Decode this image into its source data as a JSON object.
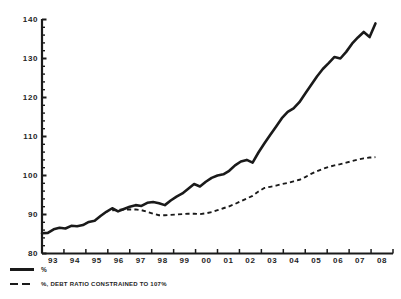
{
  "chart_data": {
    "type": "line",
    "title": "",
    "subtitle": "",
    "xlabel": "",
    "ylabel": "",
    "ylim": [
      80,
      140
    ],
    "ytick_step": 10,
    "yticks": [
      80,
      90,
      100,
      110,
      120,
      130,
      140
    ],
    "minor_ticks": true,
    "grid": false,
    "legend_position": "below-left",
    "xticks": [
      "93",
      "94",
      "95",
      "96",
      "97",
      "98",
      "99",
      "00",
      "01",
      "02",
      "03",
      "04",
      "05",
      "06",
      "07",
      "08"
    ],
    "x_range": [
      1993,
      2008
    ],
    "series": [
      {
        "name": "%",
        "style": "solid",
        "color": "#1a1a1a",
        "x": [
          1993.0,
          1993.25,
          1993.5,
          1993.75,
          1994.0,
          1994.25,
          1994.5,
          1994.75,
          1995.0,
          1995.25,
          1995.5,
          1995.75,
          1996.0,
          1996.25,
          1996.5,
          1996.75,
          1997.0,
          1997.25,
          1997.5,
          1997.75,
          1998.0,
          1998.25,
          1998.5,
          1998.75,
          1999.0,
          1999.25,
          1999.5,
          1999.75,
          2000.0,
          2000.25,
          2000.5,
          2000.75,
          2001.0,
          2001.25,
          2001.5,
          2001.75,
          2002.0,
          2002.25,
          2002.5,
          2002.75,
          2003.0,
          2003.25,
          2003.5,
          2003.75,
          2004.0,
          2004.25,
          2004.5,
          2004.75,
          2005.0,
          2005.25,
          2005.5,
          2005.75,
          2006.0,
          2006.25,
          2006.5,
          2006.75,
          2007.0,
          2007.25
        ],
        "values": [
          85.2,
          85.3,
          86.2,
          86.6,
          86.4,
          87.1,
          87.0,
          87.3,
          88.1,
          88.4,
          89.6,
          90.7,
          91.6,
          90.8,
          91.4,
          92.0,
          92.4,
          92.2,
          93.0,
          93.2,
          92.9,
          92.4,
          93.6,
          94.6,
          95.4,
          96.6,
          97.8,
          97.2,
          98.4,
          99.4,
          100.0,
          100.3,
          101.2,
          102.6,
          103.6,
          104.0,
          103.3,
          105.9,
          108.2,
          110.4,
          112.5,
          114.7,
          116.3,
          117.2,
          118.8,
          121.0,
          123.2,
          125.4,
          127.3,
          128.8,
          130.4,
          130.0,
          131.7,
          133.8,
          135.4,
          136.8,
          135.5,
          139.0
        ]
      },
      {
        "name": "%, DEBT RATIO CONSTRAINED TO 107%",
        "style": "dashed",
        "color": "#1a1a1a",
        "x": [
          1996.0,
          1996.25,
          1996.5,
          1996.75,
          1997.0,
          1997.25,
          1997.5,
          1997.75,
          1998.0,
          1998.25,
          1998.5,
          1998.75,
          1999.0,
          1999.25,
          1999.5,
          1999.75,
          2000.0,
          2000.25,
          2000.5,
          2000.75,
          2001.0,
          2001.25,
          2001.5,
          2001.75,
          2002.0,
          2002.25,
          2002.5,
          2002.75,
          2003.0,
          2003.25,
          2003.5,
          2003.75,
          2004.0,
          2004.25,
          2004.5,
          2004.75,
          2005.0,
          2005.25,
          2005.5,
          2005.75,
          2006.0,
          2006.25,
          2006.5,
          2006.75,
          2007.0,
          2007.25
        ],
        "values": [
          91.1,
          91.2,
          91.3,
          91.3,
          91.3,
          91.1,
          90.7,
          90.2,
          89.8,
          89.8,
          89.9,
          90.0,
          90.1,
          90.2,
          90.2,
          90.1,
          90.3,
          90.6,
          91.1,
          91.6,
          92.1,
          92.7,
          93.4,
          94.1,
          94.8,
          95.9,
          96.8,
          97.1,
          97.4,
          97.8,
          98.1,
          98.5,
          98.9,
          99.6,
          100.4,
          101.1,
          101.7,
          102.2,
          102.6,
          102.9,
          103.3,
          103.7,
          104.1,
          104.4,
          104.6,
          104.7
        ]
      }
    ]
  },
  "legend": {
    "items": [
      {
        "label": "%",
        "style": "solid"
      },
      {
        "label": "%, DEBT RATIO CONSTRAINED TO 107%",
        "style": "dashed"
      }
    ]
  },
  "axis": {
    "y_labels": [
      "140",
      "130",
      "120",
      "110",
      "100",
      "90",
      "80"
    ],
    "x_labels": [
      "93",
      "94",
      "95",
      "96",
      "97",
      "98",
      "99",
      "00",
      "01",
      "02",
      "03",
      "04",
      "05",
      "06",
      "07",
      "08"
    ]
  }
}
